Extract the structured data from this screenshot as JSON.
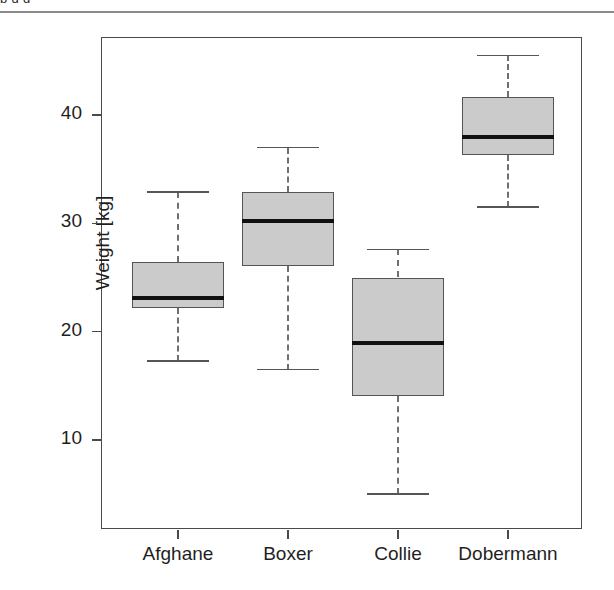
{
  "page": {
    "top_text_fragment": "p  g  g",
    "background": "#ffffff"
  },
  "chart_data": {
    "type": "box",
    "title": "",
    "xlabel": "",
    "ylabel": "Weight [kg]",
    "categories": [
      "Afghane",
      "Boxer",
      "Collie",
      "Dobermann"
    ],
    "ylim": [
      3,
      46.5
    ],
    "yticks": [
      10,
      20,
      30,
      40
    ],
    "ytick_labels": [
      "10",
      "20",
      "30",
      "40"
    ],
    "grid": false,
    "legend": "none",
    "colors": {
      "box_fill": "#cbcbcb",
      "box_border": "#555555",
      "median": "#101010",
      "whisker": "#6f6f6f",
      "frame": "#4a4a4a",
      "text": "#1f1f1f"
    },
    "boxes": [
      {
        "label": "Afghane",
        "whisker_low": 17.3,
        "q1": 22.2,
        "median": 23.1,
        "q3": 26.4,
        "whisker_high": 32.9
      },
      {
        "label": "Boxer",
        "whisker_low": 16.5,
        "q1": 26.1,
        "median": 30.2,
        "q3": 32.9,
        "whisker_high": 37.0
      },
      {
        "label": "Collie",
        "whisker_low": 5.0,
        "q1": 14.1,
        "median": 19.0,
        "q3": 25.0,
        "whisker_high": 27.6
      },
      {
        "label": "Dobermann",
        "whisker_low": 31.5,
        "q1": 36.3,
        "median": 38.0,
        "q3": 41.7,
        "whisker_high": 45.5
      }
    ]
  }
}
